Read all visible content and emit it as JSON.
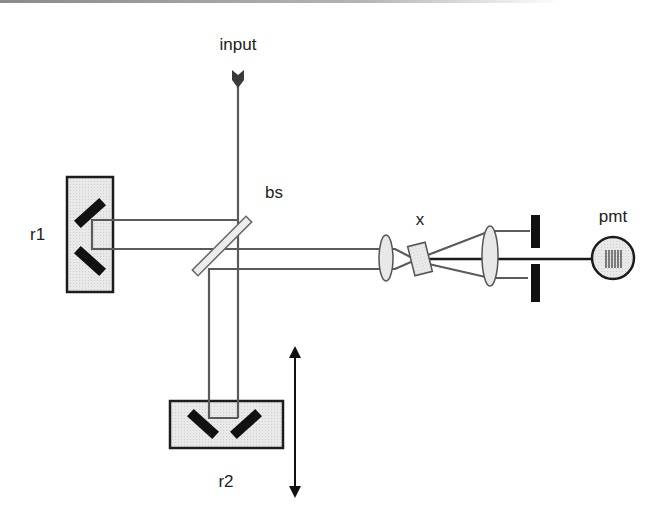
{
  "diagram": {
    "labels": {
      "input": "input",
      "beamsplitter": "bs",
      "retroreflector_1": "r1",
      "retroreflector_2": "r2",
      "crystal": "x",
      "detector": "pmt"
    },
    "components": [
      {
        "id": "input",
        "type": "input-beam-arrow"
      },
      {
        "id": "bs",
        "type": "beamsplitter"
      },
      {
        "id": "r1",
        "type": "fixed-retroreflector",
        "mirrors": 2
      },
      {
        "id": "r2",
        "type": "movable-retroreflector",
        "mirrors": 2,
        "motion": "vertical-translation"
      },
      {
        "id": "lens1",
        "type": "focusing-lens"
      },
      {
        "id": "x",
        "type": "nonlinear-crystal"
      },
      {
        "id": "lens2",
        "type": "collimating-lens"
      },
      {
        "id": "aperture",
        "type": "slit-pair"
      },
      {
        "id": "pmt",
        "type": "photomultiplier-detector"
      }
    ],
    "colors": {
      "beam": "#5a5a5a",
      "signal_beam": "#1a1a1a",
      "component_fill": "#e6e6e6",
      "component_stroke": "#1c1c1c"
    }
  }
}
